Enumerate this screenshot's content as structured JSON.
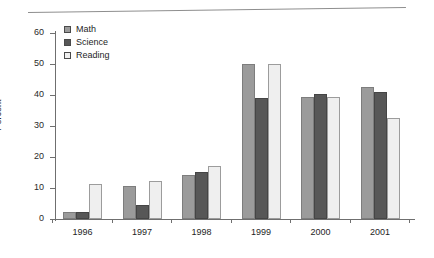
{
  "chart_data": {
    "type": "bar",
    "title": "",
    "xlabel": "",
    "ylabel": "Percent",
    "ylim": [
      0,
      60
    ],
    "yticks": [
      0,
      10,
      20,
      30,
      40,
      50,
      60
    ],
    "grid": false,
    "legend_position": "top-left",
    "categories": [
      "1996",
      "1997",
      "1998",
      "1999",
      "2000",
      "2001"
    ],
    "series": [
      {
        "name": "Math",
        "color": "#9b9b9b",
        "values": [
          2.3,
          10.7,
          14.2,
          50.0,
          39.5,
          42.5
        ]
      },
      {
        "name": "Science",
        "color": "#575757",
        "values": [
          2.3,
          4.5,
          15.2,
          39.0,
          40.3,
          41.0
        ]
      },
      {
        "name": "Reading",
        "color": "#efefef",
        "values": [
          11.3,
          12.3,
          17.1,
          50.0,
          39.5,
          32.5
        ]
      }
    ]
  },
  "axis": {
    "y_title": "Percent",
    "y_tick_labels": [
      "60",
      "50",
      "40",
      "30",
      "20",
      "10",
      "0"
    ],
    "x_tick_labels": [
      "1996",
      "1997",
      "1998",
      "1999",
      "2000",
      "2001"
    ]
  },
  "legend": {
    "items": [
      {
        "label": "Math",
        "color": "#9b9b9b"
      },
      {
        "label": "Science",
        "color": "#575757"
      },
      {
        "label": "Reading",
        "color": "#efefef"
      }
    ]
  }
}
